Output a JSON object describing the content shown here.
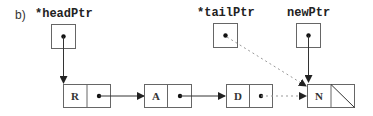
{
  "figure": {
    "part_label": "b)",
    "pointers": [
      {
        "name": "*headPtr",
        "target": "R"
      },
      {
        "name": "*tailPtr",
        "target": "N"
      },
      {
        "name": "newPtr",
        "target": "N"
      }
    ],
    "nodes": [
      {
        "value": "R",
        "next": "A"
      },
      {
        "value": "A",
        "next": "D"
      },
      {
        "value": "D",
        "next": "N"
      },
      {
        "value": "N",
        "next": "null"
      }
    ],
    "colors": {
      "line": "#333333",
      "box": "#666666",
      "dashed": "#999999"
    }
  }
}
